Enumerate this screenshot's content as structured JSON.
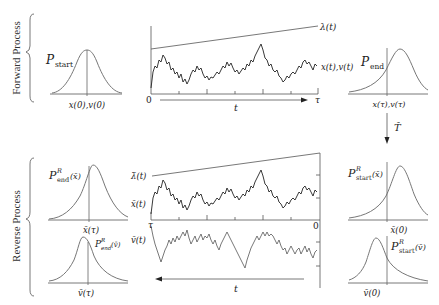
{
  "figure": {
    "forward": {
      "section_label": "Forward Process",
      "p_start": {
        "symbol": "P",
        "sub": "start",
        "axis_label": "x(0),v(0)"
      },
      "trajectory": {
        "lambda_label": "λ(t)",
        "trace_label": "x(t),v(t)",
        "origin_label": "0",
        "end_label": "τ",
        "time_label": "t"
      },
      "p_end": {
        "symbol": "P",
        "sub": "end",
        "axis_label": "x(τ),v(τ)"
      }
    },
    "operator": {
      "label": "T̂"
    },
    "reverse": {
      "section_label": "Reverse Process",
      "p_end_x": {
        "symbol": "P",
        "sup": "R",
        "sub": "end",
        "arg": "(x̄)",
        "axis_label": "x̄(τ)"
      },
      "p_end_v": {
        "symbol": "P",
        "sup": "R",
        "sub": "end",
        "arg": "(v̄)",
        "axis_label": "v̄(τ)"
      },
      "trajectory": {
        "lambda_label": "λ̄(t)",
        "x_trace_label": "x̄(t)",
        "v_trace_label": "v̄(t)",
        "start_label": "τ",
        "end_label": "0",
        "time_label": "t"
      },
      "p_start_x": {
        "symbol": "P",
        "sup": "R",
        "sub": "start",
        "arg": "(x̄)",
        "axis_label": "x̄(0)"
      },
      "p_start_v": {
        "symbol": "P",
        "sup": "R",
        "sub": "start",
        "arg": "(v̄)",
        "axis_label": "v̄(0)"
      }
    },
    "colors": {
      "trace": "#222222",
      "axis": "#555555",
      "curve": "#777777"
    }
  }
}
